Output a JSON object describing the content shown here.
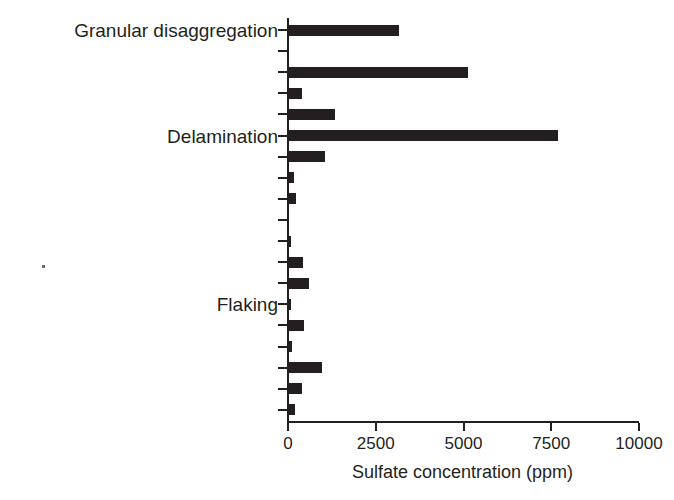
{
  "chart_data": {
    "type": "bar",
    "orientation": "horizontal",
    "title": "",
    "subtitle": "",
    "xlabel": "Sulfate concentration (ppm)",
    "ylabel": "",
    "xlim": [
      0,
      10000
    ],
    "xticks": [
      0,
      2500,
      5000,
      7500,
      10000
    ],
    "xtick_labels": [
      "0",
      "2500",
      "5000",
      "7500",
      "10000"
    ],
    "grid": false,
    "legend": null,
    "bar_color": "#231f20",
    "axis_color": "#231f20",
    "background_color": "#ffffff",
    "categories": [
      "Granular disaggregation",
      "",
      "",
      "",
      "",
      "Delamination",
      "",
      "",
      "",
      "",
      "",
      "",
      "",
      "Flaking",
      "",
      "",
      "",
      "",
      ""
    ],
    "values": [
      3160,
      0,
      5130,
      400,
      1350,
      7690,
      1050,
      180,
      230,
      0,
      90,
      420,
      600,
      80,
      470,
      120,
      980,
      400,
      200
    ],
    "annotations": [],
    "labeled_categories": [
      {
        "index": 0,
        "label": "Granular disaggregation"
      },
      {
        "index": 5,
        "label": "Delamination"
      },
      {
        "index": 13,
        "label": "Flaking"
      }
    ]
  }
}
